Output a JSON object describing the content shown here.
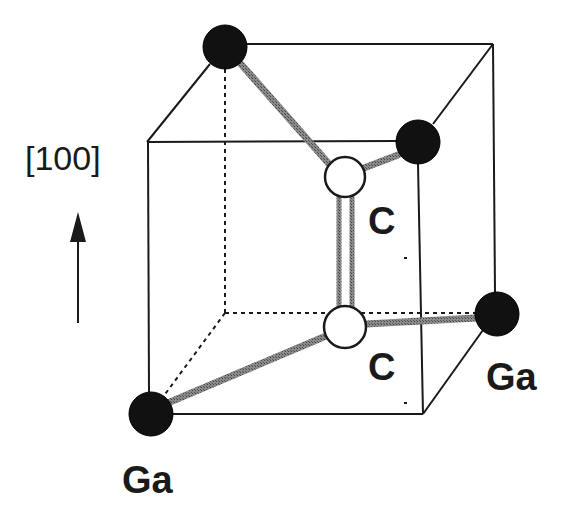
{
  "diagram": {
    "type": "crystal-structure",
    "direction_label": "[100]",
    "atoms": [
      {
        "id": "ga-back-top-left",
        "element": "Ga",
        "x": 225,
        "y": 47,
        "r": 22,
        "fill": "#111111"
      },
      {
        "id": "ga-front-top-right",
        "element": "Ga",
        "x": 418,
        "y": 142,
        "r": 22,
        "fill": "#111111"
      },
      {
        "id": "ga-front-bottom-left",
        "element": "Ga",
        "x": 151,
        "y": 414,
        "r": 22,
        "fill": "#111111"
      },
      {
        "id": "ga-back-bottom-right",
        "element": "Ga",
        "x": 497,
        "y": 314,
        "r": 22,
        "fill": "#111111"
      },
      {
        "id": "c-top",
        "element": "C",
        "x": 345,
        "y": 177,
        "r": 20,
        "fill": "#ffffff"
      },
      {
        "id": "c-bottom",
        "element": "C",
        "x": 345,
        "y": 327,
        "r": 21,
        "fill": "#ffffff"
      }
    ],
    "labels": {
      "c_top": "C",
      "c_bottom": "C",
      "ga_right": "Ga",
      "ga_bottom": "Ga"
    },
    "colors": {
      "ink": "#1a1a1a",
      "bond": "#7a7a7a",
      "ga_atom": "#111111",
      "c_atom": "#ffffff"
    }
  }
}
